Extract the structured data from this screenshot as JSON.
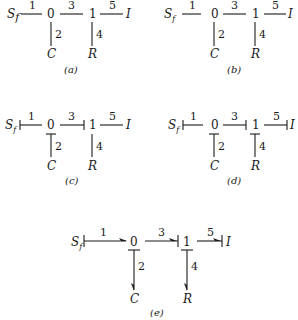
{
  "figure": {
    "panels": [
      {
        "id": "a",
        "caption": "(a)",
        "source": {
          "label": "S",
          "sub": "f"
        },
        "junction0": "0",
        "junction1": "1",
        "inertia": "I",
        "capacitor": "C",
        "resistor": "R",
        "bonds": [
          "1",
          "2",
          "3",
          "4",
          "5"
        ],
        "causal_strokes": false,
        "power_arrows": false
      },
      {
        "id": "b",
        "caption": "(b)",
        "source": {
          "label": "S",
          "sub": "f"
        },
        "junction0": "0",
        "junction1": "1",
        "inertia": "I",
        "capacitor": "C",
        "resistor": "R",
        "bonds": [
          "1",
          "2",
          "3",
          "4",
          "5"
        ],
        "causal_strokes": false,
        "power_arrows": false
      },
      {
        "id": "c",
        "caption": "(c)",
        "source": {
          "label": "S",
          "sub": "f"
        },
        "junction0": "0",
        "junction1": "1",
        "inertia": "I",
        "capacitor": "C",
        "resistor": "R",
        "bonds": [
          "1",
          "2",
          "3",
          "4",
          "5"
        ],
        "causal_strokes": [
          "1",
          "2",
          "3"
        ],
        "power_arrows": false
      },
      {
        "id": "d",
        "caption": "(d)",
        "source": {
          "label": "S",
          "sub": "f"
        },
        "junction0": "0",
        "junction1": "1",
        "inertia": "I",
        "capacitor": "C",
        "resistor": "R",
        "bonds": [
          "1",
          "2",
          "3",
          "4",
          "5"
        ],
        "causal_strokes": [
          "1",
          "2",
          "3",
          "4",
          "5"
        ],
        "power_arrows": false
      },
      {
        "id": "e",
        "caption": "(e)",
        "source": {
          "label": "S",
          "sub": "f"
        },
        "junction0": "0",
        "junction1": "1",
        "inertia": "I",
        "capacitor": "C",
        "resistor": "R",
        "bonds": [
          "1",
          "2",
          "3",
          "4",
          "5"
        ],
        "causal_strokes": [
          "1",
          "2",
          "3",
          "4",
          "5"
        ],
        "power_arrows": [
          "1",
          "2",
          "3",
          "4",
          "5"
        ]
      }
    ]
  }
}
